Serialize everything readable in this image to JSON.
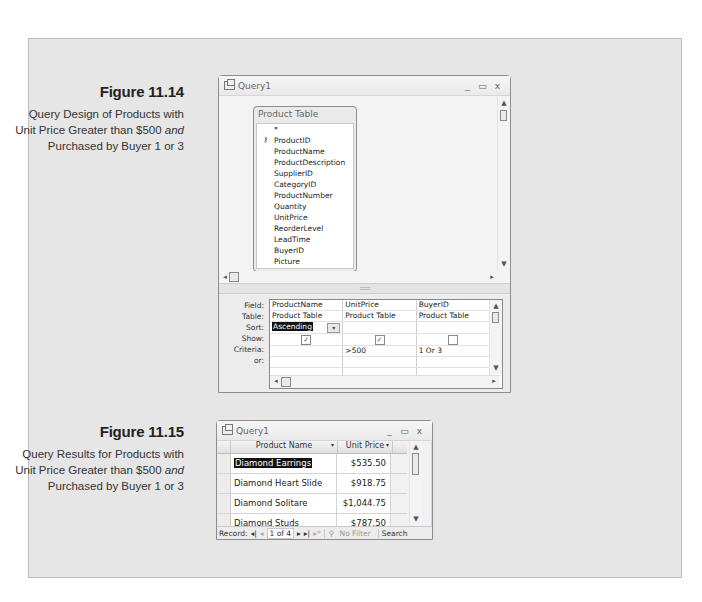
{
  "figures": [
    {
      "title": "Figure 11.14",
      "description_parts": [
        "Query Design of Products with Unit Price Greater than $500 ",
        "and",
        " Purchased by Buyer 1 or 3"
      ]
    },
    {
      "title": "Figure 11.15",
      "description_parts": [
        "Query Results for Products with Unit Price Greater than $500 ",
        "and",
        " Purchased by Buyer 1 or 3"
      ]
    }
  ],
  "design_window": {
    "title": "Query1",
    "controls": {
      "minimize": "_",
      "maximize": "▭",
      "close": "x"
    },
    "table_box": {
      "title": "Product Table",
      "fields": [
        "*",
        "ProductID",
        "ProductName",
        "ProductDescription",
        "SupplierID",
        "CategoryID",
        "ProductNumber",
        "Quantity",
        "UnitPrice",
        "ReorderLevel",
        "LeadTime",
        "BuyerID",
        "Picture"
      ],
      "primary_key": "ProductID"
    },
    "grid": {
      "row_labels": [
        "Field:",
        "Table:",
        "Sort:",
        "Show:",
        "Criteria:",
        "or:"
      ],
      "columns": [
        {
          "field": "ProductName",
          "table": "Product Table",
          "sort": "Ascending",
          "show": true,
          "criteria": "",
          "or": ""
        },
        {
          "field": "UnitPrice",
          "table": "Product Table",
          "sort": "",
          "show": true,
          "criteria": ">500",
          "or": ""
        },
        {
          "field": "BuyerID",
          "table": "Product Table",
          "sort": "",
          "show": false,
          "criteria": "1 Or 3",
          "or": ""
        }
      ]
    }
  },
  "results_window": {
    "title": "Query1",
    "controls": {
      "minimize": "_",
      "maximize": "▭",
      "close": "x"
    },
    "columns": [
      "Product Name",
      "Unit Price"
    ],
    "rows": [
      {
        "name": "Diamond Earrings",
        "price": "$535.50"
      },
      {
        "name": "Diamond Heart Slide",
        "price": "$918.75"
      },
      {
        "name": "Diamond Solitare Earrings",
        "price": "$1,044.75"
      },
      {
        "name": "Diamond Studs",
        "price": "$787.50"
      }
    ],
    "navigation": {
      "record_label": "Record:",
      "first": "◂|",
      "prev": "◂",
      "position": "1 of 4",
      "next": "▸",
      "last": "▸|",
      "new": "▸*",
      "filter": "No Filter",
      "search": "Search"
    }
  }
}
